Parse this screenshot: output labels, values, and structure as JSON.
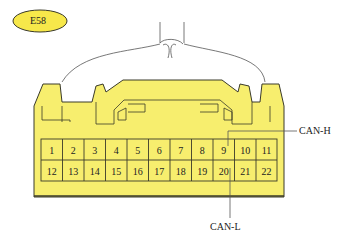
{
  "connector": {
    "id": "E58",
    "badge_color": "#f7e84a",
    "body_color": "#f7ee6e",
    "outline_color": "#3a3a2a"
  },
  "pins": {
    "row1": [
      "1",
      "2",
      "3",
      "4",
      "5",
      "6",
      "7",
      "8",
      "9",
      "10",
      "11"
    ],
    "row2": [
      "12",
      "13",
      "14",
      "15",
      "16",
      "17",
      "18",
      "19",
      "20",
      "21",
      "22"
    ]
  },
  "callouts": [
    {
      "label": "CAN-H",
      "pin": "9"
    },
    {
      "label": "CAN-L",
      "pin": "20"
    }
  ]
}
